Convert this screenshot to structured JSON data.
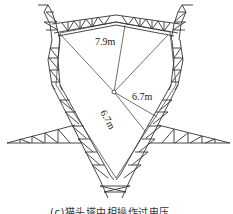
{
  "diagram": {
    "type": "transmission-tower-clearance",
    "labels": {
      "top_distance": "7.9m",
      "right_distance": "6.7m",
      "lower_distance": "6.7m"
    },
    "caption": "(c)猫头塔中相操作过电压"
  },
  "colors": {
    "stroke": "#333333",
    "background": "#ffffff"
  }
}
